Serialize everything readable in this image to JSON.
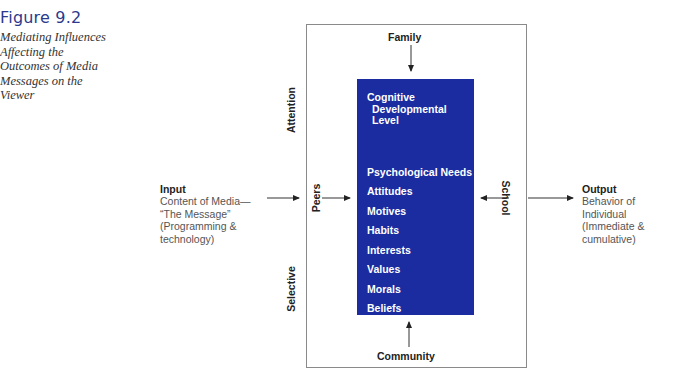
{
  "figure": {
    "number": "Figure 9.2",
    "caption_lines": [
      "Mediating Influences",
      "Affecting the",
      "Outcomes of Media",
      "Messages on the",
      "Viewer"
    ]
  },
  "diagram": {
    "top_label": "Family",
    "bottom_label": "Community",
    "left_inner_label": "Peers",
    "right_inner_label": "School",
    "left_outer_top_label": "Attention",
    "left_outer_bottom_label": "Selective",
    "core": {
      "first_item_lines": [
        "Cognitive",
        "Developmental",
        "Level"
      ],
      "items": [
        "Psychological Needs",
        "Attitudes",
        "Motives",
        "Habits",
        "Interests",
        "Values",
        "Morals",
        "Beliefs",
        "Experiences"
      ]
    },
    "input": {
      "title": "Input",
      "lines": [
        "Content of Media—",
        "“The Message”",
        "(Programming &",
        "technology)"
      ]
    },
    "output": {
      "title": "Output",
      "lines": [
        "Behavior of",
        "Individual",
        "(Immediate &",
        "cumulative)"
      ]
    },
    "colors": {
      "core_fill": "#1a2ca0",
      "figure_number": "#2b3a8c",
      "box_border": "#8a8a8a"
    }
  }
}
